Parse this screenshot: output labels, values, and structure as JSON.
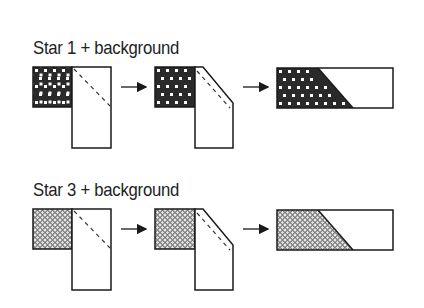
{
  "rows": [
    {
      "label": "Star 1 + background",
      "fabric": "dark-checker"
    },
    {
      "label": "Star 3 + background",
      "fabric": "light-lattice"
    }
  ],
  "steps": [
    "place squares right sides together and sew on diagonal",
    "trim corner",
    "press open"
  ],
  "colors": {
    "line": "#1a1a1a",
    "dark_fabric": "#2a2a2a",
    "background": "#ffffff"
  }
}
